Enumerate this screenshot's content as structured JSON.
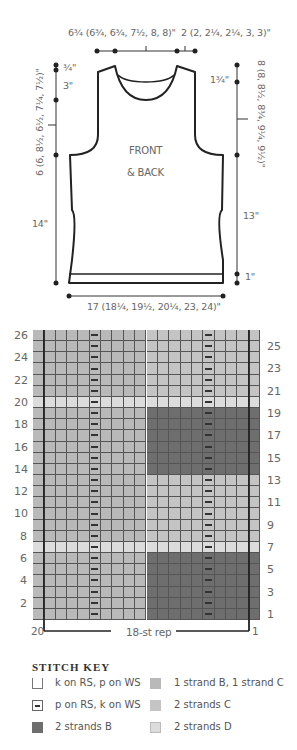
{
  "schematic": {
    "top_left_label": "6¾ (6¾, 6¾, 7½, 8, 8)\"",
    "top_right_label": "2 (2, 2¼, 2¼, 3, 3)\"",
    "left_top_label": "¾\"",
    "left_second_label": "3\"",
    "left_armhole_label": "6 (6, 8½, 6½, 7¼, 7½)\"",
    "left_body_label": "14\"",
    "right_top_label": "1¾\"",
    "right_armhole_label": "8 (8, 8½, 8¾, 9¼, 9½)\"",
    "right_body_label": "13\"",
    "right_hem_label": "1\"",
    "bottom_label": "17 (18¼, 19½, 20¼, 23, 24)\"",
    "piece_title_line1": "FRONT",
    "piece_title_line2": "& BACK"
  },
  "chart": {
    "left_row_numbers": [
      "26",
      "24",
      "22",
      "20",
      "18",
      "16",
      "14",
      "12",
      "10",
      "8",
      "6",
      "4",
      "2"
    ],
    "right_row_numbers": [
      "25",
      "23",
      "21",
      "19",
      "17",
      "15",
      "13",
      "11",
      "9",
      "7",
      "5",
      "3",
      "1"
    ],
    "bottom_left_stitch": "20",
    "bottom_right_stitch": "1",
    "repeat_label": "18-st rep"
  },
  "colors": {
    "strand_B_C": "#b9b9b9",
    "strand_C": "#c4c4c4",
    "strand_B": "#6e6e6e",
    "strand_D": "#dcdcdc"
  },
  "chart_data": {
    "type": "heatmap",
    "columns": 20,
    "rows": 26,
    "row_order": "bottom-to-top (row 1 at bottom)",
    "column_order": "right-to-left (st 1 at right, st 20 at left)",
    "repeat": "18-st rep (sts 2–19)",
    "purl_columns_from_left": [
      6,
      16
    ],
    "row_bands": [
      {
        "rows": "1-6",
        "left_10_sts": "1 strand B, 1 strand C",
        "right_10_sts": "2 strands B"
      },
      {
        "rows": "7",
        "all_sts": "2 strands D"
      },
      {
        "rows": "8-13",
        "left_10_sts": "1 strand B, 1 strand C",
        "right_10_sts": "2 strands C"
      },
      {
        "rows": "14-19",
        "left_10_sts": "1 strand B, 1 strand C",
        "right_10_sts": "2 strands B"
      },
      {
        "rows": "20",
        "all_sts": "2 strands D"
      },
      {
        "rows": "21-26",
        "left_10_sts": "1 strand B, 1 strand C",
        "right_10_sts": "2 strands C"
      }
    ]
  },
  "stitch_key": {
    "title": "STITCH KEY",
    "items": [
      {
        "symbol": "empty-square",
        "label": "k on RS, p on WS"
      },
      {
        "symbol": "dash-square",
        "label": "p on RS, k on WS"
      },
      {
        "symbol": "dark-square",
        "label": "2 strands B"
      },
      {
        "symbol": "medium-square",
        "label": "1 strand B, 1 strand C"
      },
      {
        "symbol": "medium-light-square",
        "label": "2 strands C"
      },
      {
        "symbol": "light-square",
        "label": "2 strands D"
      }
    ]
  }
}
